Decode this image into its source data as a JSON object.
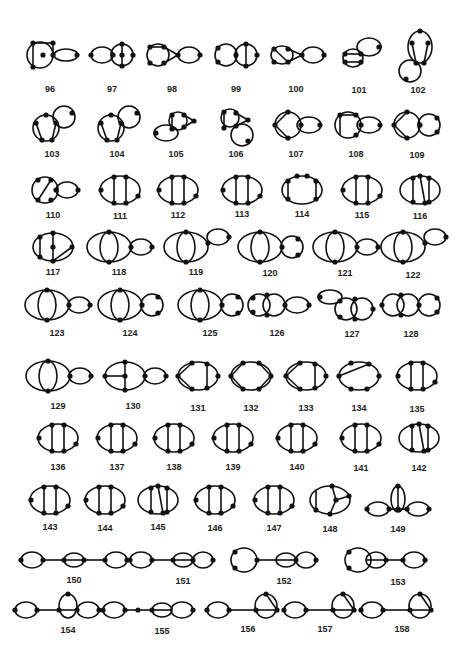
{
  "figure": {
    "label_range": "96-158",
    "ink_color": "#111111",
    "background": "#ffffff"
  },
  "graphs": [
    {
      "id": "96",
      "x": 50,
      "y": 55,
      "ly": 89,
      "kind": "theta-chord-loop"
    },
    {
      "id": "97",
      "x": 112,
      "y": 55,
      "ly": 89,
      "kind": "loop-theta"
    },
    {
      "id": "98",
      "x": 172,
      "y": 55,
      "ly": 89,
      "kind": "square-triangle-loop"
    },
    {
      "id": "99",
      "x": 236,
      "y": 55,
      "ly": 89,
      "kind": "circle-theta"
    },
    {
      "id": "100",
      "x": 296,
      "y": 55,
      "ly": 89,
      "kind": "square-diag-triangle-loop"
    },
    {
      "id": "101",
      "x": 359,
      "y": 55,
      "ly": 90,
      "kind": "box-loop-up"
    },
    {
      "id": "102",
      "x": 418,
      "y": 55,
      "ly": 90,
      "kind": "tall-loop-down"
    },
    {
      "id": "103",
      "x": 52,
      "y": 125,
      "ly": 154,
      "kind": "pent-loop-up"
    },
    {
      "id": "104",
      "x": 117,
      "y": 125,
      "ly": 154,
      "kind": "pent-loop-up"
    },
    {
      "id": "105",
      "x": 176,
      "y": 125,
      "ly": 154,
      "kind": "triangle-box-loop-down"
    },
    {
      "id": "106",
      "x": 236,
      "y": 125,
      "ly": 154,
      "kind": "triangle-box-circle-down"
    },
    {
      "id": "107",
      "x": 296,
      "y": 125,
      "ly": 154,
      "kind": "circle-chords-loop"
    },
    {
      "id": "108",
      "x": 356,
      "y": 125,
      "ly": 154,
      "kind": "box-circle-loop"
    },
    {
      "id": "109",
      "x": 417,
      "y": 125,
      "ly": 155,
      "kind": "circle-chords-circle"
    },
    {
      "id": "110",
      "x": 53,
      "y": 190,
      "ly": 215,
      "kind": "circle-diag-loop"
    },
    {
      "id": "111",
      "x": 120,
      "y": 190,
      "ly": 216,
      "kind": "ellipse-2chords"
    },
    {
      "id": "112",
      "x": 178,
      "y": 190,
      "ly": 215,
      "kind": "ellipse-2chords"
    },
    {
      "id": "113",
      "x": 242,
      "y": 190,
      "ly": 214,
      "kind": "ellipse-2chords"
    },
    {
      "id": "114",
      "x": 302,
      "y": 190,
      "ly": 214,
      "kind": "ellipse-4top"
    },
    {
      "id": "115",
      "x": 362,
      "y": 190,
      "ly": 215,
      "kind": "ellipse-2chords"
    },
    {
      "id": "116",
      "x": 420,
      "y": 190,
      "ly": 216,
      "kind": "ellipse-3chords"
    },
    {
      "id": "117",
      "x": 53,
      "y": 247,
      "ly": 272,
      "kind": "ellipse-spoke"
    },
    {
      "id": "118",
      "x": 119,
      "y": 247,
      "ly": 272,
      "kind": "lens-loop"
    },
    {
      "id": "119",
      "x": 196,
      "y": 247,
      "ly": 272,
      "kind": "lens-loop-up"
    },
    {
      "id": "120",
      "x": 270,
      "y": 247,
      "ly": 273,
      "kind": "lens-circle"
    },
    {
      "id": "121",
      "x": 345,
      "y": 247,
      "ly": 273,
      "kind": "lens-loop"
    },
    {
      "id": "122",
      "x": 413,
      "y": 247,
      "ly": 275,
      "kind": "lens-loop-up"
    },
    {
      "id": "123",
      "x": 57,
      "y": 305,
      "ly": 333,
      "kind": "lens-loop"
    },
    {
      "id": "124",
      "x": 130,
      "y": 305,
      "ly": 333,
      "kind": "lens-circle"
    },
    {
      "id": "125",
      "x": 210,
      "y": 305,
      "ly": 333,
      "kind": "lens-circle"
    },
    {
      "id": "126",
      "x": 277,
      "y": 305,
      "ly": 333,
      "kind": "double-circle-loop"
    },
    {
      "id": "127",
      "x": 352,
      "y": 305,
      "ly": 334,
      "kind": "loop-double-circle"
    },
    {
      "id": "128",
      "x": 411,
      "y": 305,
      "ly": 334,
      "kind": "double-circle-circle"
    },
    {
      "id": "129",
      "x": 58,
      "y": 376,
      "ly": 406,
      "kind": "lens-loop"
    },
    {
      "id": "130",
      "x": 133,
      "y": 376,
      "ly": 406,
      "kind": "ellipse-T-loop"
    },
    {
      "id": "131",
      "x": 198,
      "y": 376,
      "ly": 408,
      "kind": "ellipse-chords"
    },
    {
      "id": "132",
      "x": 251,
      "y": 376,
      "ly": 408,
      "kind": "hexagon"
    },
    {
      "id": "133",
      "x": 306,
      "y": 376,
      "ly": 408,
      "kind": "ellipse-chords"
    },
    {
      "id": "134",
      "x": 359,
      "y": 376,
      "ly": 408,
      "kind": "ellipse-diag"
    },
    {
      "id": "135",
      "x": 417,
      "y": 376,
      "ly": 409,
      "kind": "ellipse-2chords"
    },
    {
      "id": "136",
      "x": 58,
      "y": 438,
      "ly": 467,
      "kind": "ellipse-2chords"
    },
    {
      "id": "137",
      "x": 117,
      "y": 438,
      "ly": 467,
      "kind": "ellipse-2chords"
    },
    {
      "id": "138",
      "x": 174,
      "y": 438,
      "ly": 467,
      "kind": "ellipse-2chords"
    },
    {
      "id": "139",
      "x": 233,
      "y": 438,
      "ly": 467,
      "kind": "ellipse-2chords"
    },
    {
      "id": "140",
      "x": 297,
      "y": 438,
      "ly": 467,
      "kind": "ellipse-2chords"
    },
    {
      "id": "141",
      "x": 361,
      "y": 438,
      "ly": 468,
      "kind": "ellipse-2chords"
    },
    {
      "id": "142",
      "x": 419,
      "y": 438,
      "ly": 468,
      "kind": "ellipse-3chords"
    },
    {
      "id": "143",
      "x": 50,
      "y": 500,
      "ly": 527,
      "kind": "ellipse-2chords"
    },
    {
      "id": "144",
      "x": 105,
      "y": 500,
      "ly": 528,
      "kind": "ellipse-2chords"
    },
    {
      "id": "145",
      "x": 158,
      "y": 500,
      "ly": 527,
      "kind": "ellipse-3chords"
    },
    {
      "id": "146",
      "x": 215,
      "y": 500,
      "ly": 528,
      "kind": "ellipse-2chords"
    },
    {
      "id": "147",
      "x": 274,
      "y": 500,
      "ly": 528,
      "kind": "ellipse-2chords"
    },
    {
      "id": "148",
      "x": 330,
      "y": 500,
      "ly": 529,
      "kind": "ellipse-Y"
    },
    {
      "id": "149",
      "x": 398,
      "y": 505,
      "ly": 529,
      "kind": "loop-lens-loop"
    },
    {
      "id": "150",
      "x": 74,
      "y": 560,
      "ly": 580,
      "kind": "chain-loop-lens-loop"
    },
    {
      "id": "151",
      "x": 183,
      "y": 560,
      "ly": 581,
      "kind": "chain-loop-lens-circle"
    },
    {
      "id": "152",
      "x": 284,
      "y": 560,
      "ly": 581,
      "kind": "chain-circle-lens-circle"
    },
    {
      "id": "153",
      "x": 398,
      "y": 560,
      "ly": 582,
      "kind": "chain-circle-lens-loop"
    },
    {
      "id": "154",
      "x": 68,
      "y": 610,
      "ly": 630,
      "kind": "chain-loop-lens-circle-top"
    },
    {
      "id": "155",
      "x": 162,
      "y": 610,
      "ly": 631,
      "kind": "chain-loop-dot-lens-circle"
    },
    {
      "id": "156",
      "x": 248,
      "y": 610,
      "ly": 629,
      "kind": "chain-loop-circle-chord"
    },
    {
      "id": "157",
      "x": 325,
      "y": 610,
      "ly": 629,
      "kind": "chain-loop-circle-chord"
    },
    {
      "id": "158",
      "x": 402,
      "y": 610,
      "ly": 629,
      "kind": "chain-loop-circle-chord"
    }
  ]
}
